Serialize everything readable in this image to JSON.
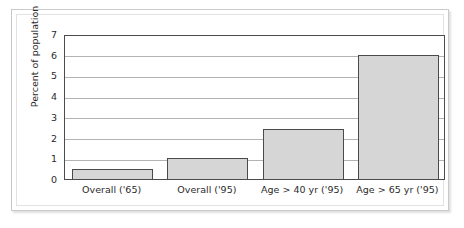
{
  "figure": {
    "background_color": "#ffffff",
    "frame_color": "#c9c9c9",
    "bar_fill_color": "#d6d6d6",
    "bar_border_color": "#4a4a4a",
    "gridline_color": "#b3b3b3",
    "axis_color": "#4c4c4c"
  },
  "chart_data": {
    "type": "bar",
    "title": "",
    "xlabel": "",
    "ylabel": "Percent of population",
    "categories": [
      "Overall ('65)",
      "Overall ('95)",
      "Age > 40 yr ('95)",
      "Age > 65 yr ('95)"
    ],
    "values": [
      0.5,
      1.0,
      2.4,
      6.0
    ],
    "ylim": [
      0,
      7
    ],
    "yticks": [
      0,
      1,
      2,
      3,
      4,
      5,
      6,
      7
    ],
    "ytick_labels": [
      "0",
      "1",
      "2",
      "3",
      "4",
      "5",
      "6",
      "7"
    ],
    "grid": true,
    "grid_axis": "y",
    "legend": false,
    "legend_position": "none",
    "orientation": "vertical"
  }
}
